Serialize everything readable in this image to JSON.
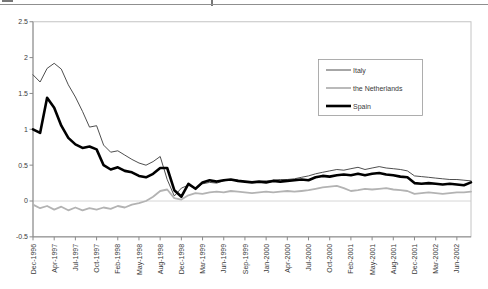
{
  "figure": {
    "top_rule_color": "#8f8f8f"
  },
  "chart_data": {
    "type": "line",
    "title": "",
    "xlabel": "",
    "ylabel": "",
    "ylim": [
      -0.5,
      2.5
    ],
    "ytick_labels": [
      "2.5",
      "2",
      "1.5",
      "1",
      "0.5",
      "0",
      "-0.5"
    ],
    "xtick_labels": [
      "Dec-1996",
      "Apr-1997",
      "Jul-1997",
      "Oct-1997",
      "Feb-1998",
      "May-1998",
      "Aug-1998",
      "Dec-1998",
      "Mar-1999",
      "Jun-1999",
      "Sep-1999",
      "Jan-2000",
      "Apr-2000",
      "Jul-2000",
      "Oct-2000",
      "Feb-2001",
      "May-2001",
      "Aug-2001",
      "Dec-2001",
      "Mar-2002",
      "Jun-2002"
    ],
    "xtick_every": 3,
    "grid": "zero-line-only",
    "legend_position": "upper-right-inside",
    "axis_color": "#8a8a8a",
    "border_color": "#c4c4c4",
    "zero_line_color": "#cccccc",
    "label_color": "#3a3a3a",
    "series": [
      {
        "name": "Italy",
        "color": "#3a3a3a",
        "stroke_width": 0.9,
        "values": [
          1.76,
          1.66,
          1.85,
          1.92,
          1.84,
          1.62,
          1.45,
          1.25,
          1.03,
          1.05,
          0.78,
          0.68,
          0.7,
          0.64,
          0.58,
          0.53,
          0.5,
          0.55,
          0.62,
          0.3,
          0.07,
          0.18,
          0.22,
          0.17,
          0.24,
          0.26,
          0.25,
          0.28,
          0.3,
          0.29,
          0.27,
          0.26,
          0.27,
          0.28,
          0.29,
          0.3,
          0.3,
          0.31,
          0.33,
          0.35,
          0.38,
          0.4,
          0.42,
          0.44,
          0.43,
          0.45,
          0.47,
          0.44,
          0.46,
          0.48,
          0.46,
          0.45,
          0.44,
          0.42,
          0.35,
          0.34,
          0.33,
          0.32,
          0.31,
          0.3,
          0.3,
          0.29,
          0.28
        ]
      },
      {
        "name": "the Netherlands",
        "color": "#b3b3b3",
        "stroke_width": 1.8,
        "values": [
          -0.05,
          -0.1,
          -0.07,
          -0.12,
          -0.08,
          -0.13,
          -0.09,
          -0.13,
          -0.1,
          -0.12,
          -0.09,
          -0.11,
          -0.07,
          -0.09,
          -0.05,
          -0.03,
          0.0,
          0.06,
          0.14,
          0.16,
          0.04,
          0.02,
          0.08,
          0.11,
          0.1,
          0.12,
          0.13,
          0.12,
          0.14,
          0.13,
          0.12,
          0.11,
          0.12,
          0.13,
          0.12,
          0.13,
          0.14,
          0.13,
          0.14,
          0.15,
          0.17,
          0.19,
          0.2,
          0.21,
          0.18,
          0.14,
          0.15,
          0.17,
          0.16,
          0.17,
          0.18,
          0.16,
          0.15,
          0.14,
          0.1,
          0.11,
          0.12,
          0.11,
          0.1,
          0.11,
          0.12,
          0.12,
          0.13
        ]
      },
      {
        "name": "Spain",
        "color": "#000000",
        "stroke_width": 2.6,
        "values": [
          1.0,
          0.95,
          1.44,
          1.3,
          1.05,
          0.88,
          0.79,
          0.74,
          0.76,
          0.72,
          0.5,
          0.44,
          0.47,
          0.42,
          0.4,
          0.35,
          0.33,
          0.38,
          0.46,
          0.46,
          0.15,
          0.06,
          0.24,
          0.17,
          0.26,
          0.29,
          0.27,
          0.29,
          0.3,
          0.28,
          0.27,
          0.26,
          0.27,
          0.26,
          0.28,
          0.27,
          0.28,
          0.29,
          0.3,
          0.29,
          0.33,
          0.35,
          0.34,
          0.36,
          0.37,
          0.36,
          0.38,
          0.36,
          0.38,
          0.39,
          0.37,
          0.36,
          0.34,
          0.33,
          0.25,
          0.24,
          0.25,
          0.24,
          0.23,
          0.24,
          0.23,
          0.22,
          0.26
        ]
      }
    ]
  }
}
